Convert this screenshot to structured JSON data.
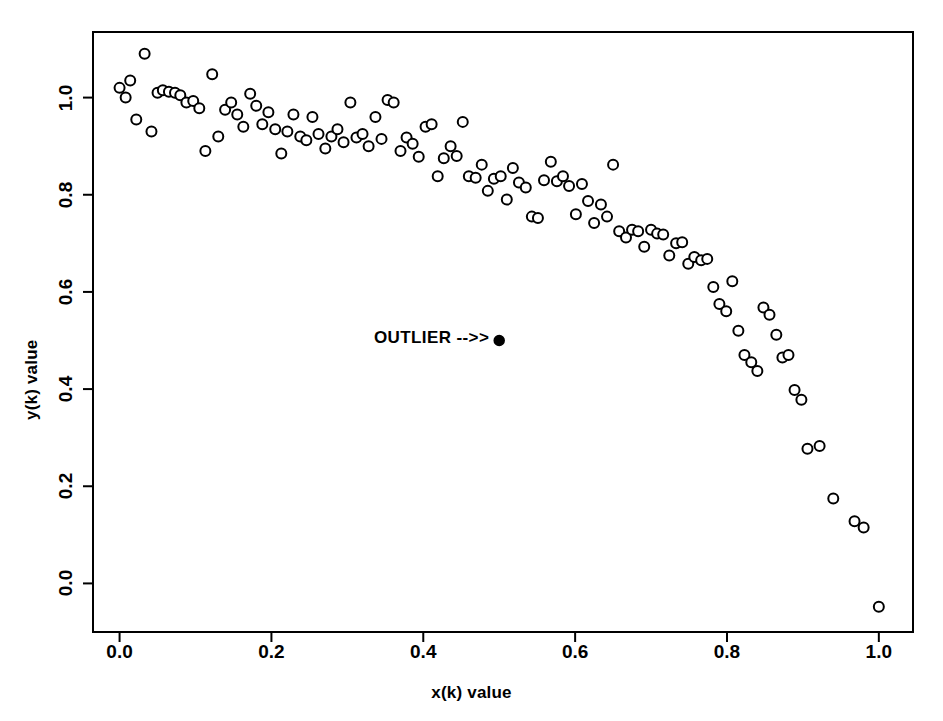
{
  "chart_data": {
    "type": "scatter",
    "title": "",
    "xlabel": "x(k) value",
    "ylabel": "y(k) value",
    "xlim": [
      -0.035,
      1.045
    ],
    "ylim": [
      -0.1,
      1.135
    ],
    "xticks": [
      0.0,
      0.2,
      0.4,
      0.6,
      0.8,
      1.0
    ],
    "xtick_labels": [
      "0.0",
      "0.2",
      "0.4",
      "0.6",
      "0.8",
      "1.0"
    ],
    "yticks": [
      0.0,
      0.2,
      0.4,
      0.6,
      0.8,
      1.0
    ],
    "ytick_labels": [
      "0.0",
      "0.2",
      "0.4",
      "0.6",
      "0.8",
      "1.0"
    ],
    "grid": false,
    "legend": "none",
    "frame": true,
    "series": [
      {
        "name": "data",
        "marker": "open-circle",
        "marker_size": 5,
        "color": "#000000",
        "points": [
          [
            0.0,
            1.02
          ],
          [
            0.008,
            1.0
          ],
          [
            0.014,
            1.035
          ],
          [
            0.022,
            0.955
          ],
          [
            0.033,
            1.09
          ],
          [
            0.042,
            0.93
          ],
          [
            0.05,
            1.01
          ],
          [
            0.057,
            1.015
          ],
          [
            0.065,
            1.012
          ],
          [
            0.073,
            1.01
          ],
          [
            0.08,
            1.005
          ],
          [
            0.088,
            0.99
          ],
          [
            0.097,
            0.993
          ],
          [
            0.105,
            0.978
          ],
          [
            0.113,
            0.89
          ],
          [
            0.122,
            1.048
          ],
          [
            0.13,
            0.92
          ],
          [
            0.139,
            0.975
          ],
          [
            0.147,
            0.99
          ],
          [
            0.155,
            0.965
          ],
          [
            0.163,
            0.94
          ],
          [
            0.172,
            1.008
          ],
          [
            0.18,
            0.983
          ],
          [
            0.188,
            0.945
          ],
          [
            0.196,
            0.97
          ],
          [
            0.205,
            0.935
          ],
          [
            0.213,
            0.885
          ],
          [
            0.221,
            0.93
          ],
          [
            0.229,
            0.965
          ],
          [
            0.238,
            0.92
          ],
          [
            0.246,
            0.912
          ],
          [
            0.254,
            0.96
          ],
          [
            0.262,
            0.925
          ],
          [
            0.271,
            0.895
          ],
          [
            0.279,
            0.92
          ],
          [
            0.287,
            0.935
          ],
          [
            0.295,
            0.908
          ],
          [
            0.304,
            0.99
          ],
          [
            0.312,
            0.918
          ],
          [
            0.32,
            0.925
          ],
          [
            0.328,
            0.9
          ],
          [
            0.337,
            0.96
          ],
          [
            0.345,
            0.915
          ],
          [
            0.353,
            0.995
          ],
          [
            0.361,
            0.99
          ],
          [
            0.37,
            0.89
          ],
          [
            0.378,
            0.918
          ],
          [
            0.386,
            0.905
          ],
          [
            0.394,
            0.878
          ],
          [
            0.403,
            0.94
          ],
          [
            0.411,
            0.945
          ],
          [
            0.419,
            0.838
          ],
          [
            0.427,
            0.875
          ],
          [
            0.436,
            0.9
          ],
          [
            0.444,
            0.88
          ],
          [
            0.452,
            0.95
          ],
          [
            0.46,
            0.838
          ],
          [
            0.469,
            0.835
          ],
          [
            0.477,
            0.862
          ],
          [
            0.485,
            0.808
          ],
          [
            0.493,
            0.833
          ],
          [
            0.502,
            0.838
          ],
          [
            0.51,
            0.79
          ],
          [
            0.518,
            0.855
          ],
          [
            0.526,
            0.825
          ],
          [
            0.535,
            0.815
          ],
          [
            0.543,
            0.755
          ],
          [
            0.551,
            0.752
          ],
          [
            0.559,
            0.83
          ],
          [
            0.568,
            0.868
          ],
          [
            0.576,
            0.828
          ],
          [
            0.584,
            0.838
          ],
          [
            0.592,
            0.818
          ],
          [
            0.601,
            0.76
          ],
          [
            0.609,
            0.822
          ],
          [
            0.617,
            0.787
          ],
          [
            0.625,
            0.742
          ],
          [
            0.634,
            0.78
          ],
          [
            0.642,
            0.755
          ],
          [
            0.65,
            0.862
          ],
          [
            0.658,
            0.725
          ],
          [
            0.667,
            0.712
          ],
          [
            0.675,
            0.728
          ],
          [
            0.683,
            0.725
          ],
          [
            0.691,
            0.693
          ],
          [
            0.7,
            0.728
          ],
          [
            0.708,
            0.72
          ],
          [
            0.716,
            0.718
          ],
          [
            0.724,
            0.675
          ],
          [
            0.733,
            0.7
          ],
          [
            0.741,
            0.702
          ],
          [
            0.749,
            0.658
          ],
          [
            0.757,
            0.672
          ],
          [
            0.766,
            0.665
          ],
          [
            0.774,
            0.668
          ],
          [
            0.782,
            0.61
          ],
          [
            0.79,
            0.575
          ],
          [
            0.799,
            0.56
          ],
          [
            0.807,
            0.622
          ],
          [
            0.815,
            0.52
          ],
          [
            0.823,
            0.47
          ],
          [
            0.832,
            0.455
          ],
          [
            0.84,
            0.437
          ],
          [
            0.848,
            0.568
          ],
          [
            0.856,
            0.553
          ],
          [
            0.865,
            0.512
          ],
          [
            0.873,
            0.465
          ],
          [
            0.881,
            0.47
          ],
          [
            0.889,
            0.398
          ],
          [
            0.898,
            0.378
          ],
          [
            0.906,
            0.277
          ],
          [
            0.922,
            0.283
          ],
          [
            0.94,
            0.175
          ],
          [
            0.968,
            0.128
          ],
          [
            0.98,
            0.115
          ],
          [
            1.0,
            -0.048
          ]
        ]
      },
      {
        "name": "outlier",
        "marker": "filled-circle",
        "marker_size": 5,
        "color": "#000000",
        "points": [
          [
            0.5,
            0.5
          ]
        ]
      }
    ],
    "annotations": [
      {
        "text": "OUTLIER -->>",
        "x": 0.335,
        "y": 0.505,
        "anchor": "start"
      }
    ]
  }
}
